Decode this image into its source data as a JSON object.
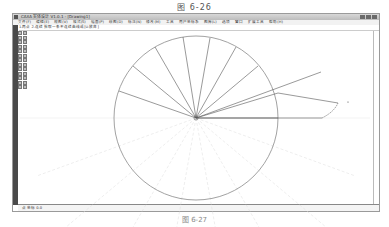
{
  "figure": {
    "caption_top": "图 6-26",
    "caption_bottom": "图 6-27"
  },
  "window": {
    "title": "CAXA 实体设计 V1.0.1 - [Drawing1]",
    "menu_items": [
      "文件(F)",
      "编辑(E)",
      "视图(V)",
      "格式(S)",
      "幅面(P)",
      "绘图(D)",
      "标注(N)",
      "修改(M)",
      "工具",
      "用户坐标系",
      "图库(L)",
      "选项",
      "窗口",
      "扩展工具",
      "帮助(H)"
    ],
    "command_line": "1.两点 2.连续 拾取一条不连续曲线或[U:放弃]",
    "status_text": "点 坐标 0.0",
    "win_controls": [
      "minimize",
      "maximize",
      "close"
    ]
  },
  "drawing": {
    "colors": {
      "line": "#555555",
      "faint": "#dddddd",
      "circle": "#8a8a8a"
    },
    "circle": {
      "cx": 196,
      "cy": 118,
      "r": 82
    },
    "spoke_endpoints_upper": [
      [
        278,
        118
      ],
      [
        278,
        93
      ],
      [
        258,
        66
      ],
      [
        236,
        47
      ],
      [
        210,
        38
      ],
      [
        183,
        37
      ],
      [
        155,
        47
      ],
      [
        133,
        66
      ],
      [
        119,
        91
      ]
    ],
    "spoke_angles_lower_deg": [
      200,
      220,
      240,
      260,
      280,
      300,
      320,
      340
    ],
    "cam_profile": {
      "horizontal_end": [
        322,
        118
      ],
      "tangent_line": [
        [
          278,
          93
        ],
        [
          338,
          103
        ]
      ],
      "extended_ray_end": [
        321,
        72
      ],
      "curve_path": "M338,103 Q334,112 322,118"
    }
  }
}
